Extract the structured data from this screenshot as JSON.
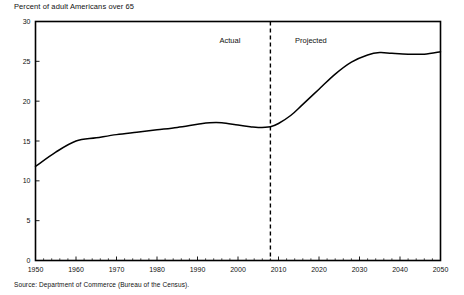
{
  "chart_data": {
    "type": "line",
    "title": "Percent of adult Americans over 65",
    "source": "Source: Department of Commerce (Bureau of the Census).",
    "xlabel": "",
    "ylabel": "",
    "xlim": [
      1950,
      2050
    ],
    "ylim": [
      0,
      30
    ],
    "xticks": [
      1950,
      1960,
      1970,
      1980,
      1990,
      2000,
      2010,
      2020,
      2030,
      2040,
      2050
    ],
    "yticks": [
      0,
      5,
      10,
      15,
      20,
      25,
      30
    ],
    "xtick_labels": [
      "1950",
      "1960",
      "1970",
      "1980",
      "1990",
      "2000",
      "2010",
      "2020",
      "2030",
      "2040",
      "2050"
    ],
    "ytick_labels": [
      "0",
      "5",
      "10",
      "15",
      "20",
      "25",
      "30"
    ],
    "grid": false,
    "legend": null,
    "annotations": [
      {
        "text": "Actual",
        "x": 1998,
        "y": 27.3
      },
      {
        "text": "Projected",
        "x": 2018,
        "y": 27.3
      }
    ],
    "divider": {
      "x": 2008,
      "style": "dashed",
      "label": "actual-projected-boundary"
    },
    "series": [
      {
        "name": "Percent of adult Americans over 65",
        "color": "#000000",
        "x": [
          1950,
          1955,
          1960,
          1965,
          1970,
          1975,
          1980,
          1985,
          1990,
          1993,
          1996,
          2000,
          2003,
          2005,
          2008,
          2010,
          2013,
          2016,
          2020,
          2024,
          2028,
          2032,
          2035,
          2038,
          2042,
          2046,
          2050
        ],
        "values": [
          11.8,
          13.6,
          15.0,
          15.4,
          15.8,
          16.1,
          16.4,
          16.7,
          17.1,
          17.3,
          17.3,
          17.0,
          16.8,
          16.7,
          16.8,
          17.2,
          18.2,
          19.6,
          21.5,
          23.4,
          24.9,
          25.8,
          26.1,
          26.0,
          25.9,
          25.9,
          26.2
        ]
      }
    ]
  }
}
